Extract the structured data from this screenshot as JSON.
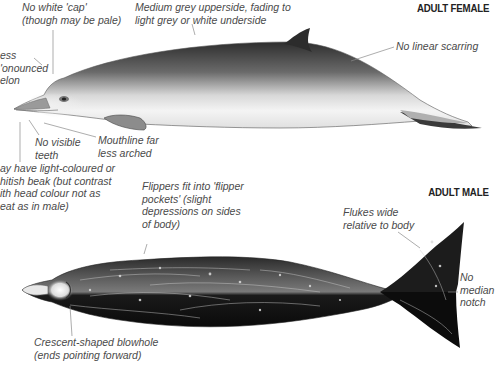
{
  "female": {
    "heading": "ADULT FEMALE",
    "labels": {
      "cap": "No white 'cap'\n(though may be pale)",
      "colour": "Medium grey upperside, fading to\nlight grey or white underside",
      "melon": "ess\n'onounced\nelon",
      "scarring": "No linear scarring",
      "teeth": "No visible\nteeth",
      "mouthline": "Mouthline far\nless arched",
      "beak": "ay have light-coloured or\nhitish beak (but contrast\nith head colour not as\neat as in male)"
    }
  },
  "male": {
    "heading": "ADULT MALE",
    "labels": {
      "flippers": "Flippers fit into 'flipper\npockets' (slight\ndepressions on sides\nof body)",
      "flukes": "Flukes wide\nrelative to body",
      "notch": "No\nmedian\nnotch",
      "blowhole": "Crescent-shaped blowhole\n(ends pointing forward)"
    }
  },
  "colors": {
    "label_text": "#4a4a4a",
    "leader_line": "#8a8a8a",
    "female_dark": "#3a3a3a",
    "female_light": "#f2f2f2",
    "male_dark": "#111111",
    "male_mid": "#555555"
  }
}
